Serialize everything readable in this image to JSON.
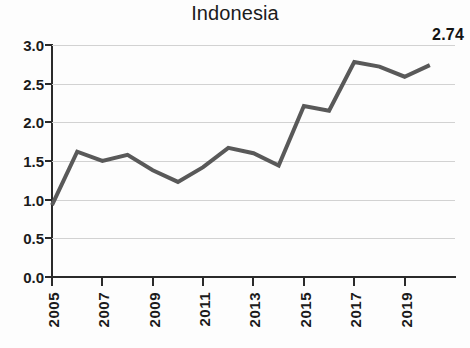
{
  "chart_data": {
    "type": "line",
    "title": "Indonesia",
    "xlabel": "",
    "ylabel": "",
    "x": [
      2005,
      2006,
      2007,
      2008,
      2009,
      2010,
      2011,
      2012,
      2013,
      2014,
      2015,
      2016,
      2017,
      2018,
      2019,
      2020
    ],
    "values": [
      0.93,
      1.62,
      1.5,
      1.58,
      1.38,
      1.23,
      1.42,
      1.67,
      1.6,
      1.44,
      2.21,
      2.15,
      2.78,
      2.72,
      2.59,
      2.74
    ],
    "series": [
      {
        "name": "Indonesia",
        "values": [
          0.93,
          1.62,
          1.5,
          1.58,
          1.38,
          1.23,
          1.42,
          1.67,
          1.6,
          1.44,
          2.21,
          2.15,
          2.78,
          2.72,
          2.59,
          2.74
        ]
      }
    ],
    "xlim": [
      2005,
      2021
    ],
    "ylim": [
      0.0,
      3.0
    ],
    "y_ticks": [
      "0.0",
      "0.5",
      "1.0",
      "1.5",
      "2.0",
      "2.5",
      "3.0"
    ],
    "y_tick_values": [
      0.0,
      0.5,
      1.0,
      1.5,
      2.0,
      2.5,
      3.0
    ],
    "x_ticks": [
      "2005",
      "2007",
      "2009",
      "2011",
      "2013",
      "2015",
      "2017",
      "2019"
    ],
    "x_tick_values": [
      2005,
      2007,
      2009,
      2011,
      2013,
      2015,
      2017,
      2019
    ],
    "grid": true,
    "grid_axis": "y",
    "legend": false,
    "legend_position": "none",
    "annotations": [
      {
        "text": "2.74",
        "value": 2.74,
        "x": 2020,
        "position": "top-right"
      }
    ],
    "line_color": "#595959",
    "grid_color": "#d2d2d2",
    "axis_color": "#2a2a2a",
    "background_color": "#fdfdfd",
    "line_width": 4
  }
}
